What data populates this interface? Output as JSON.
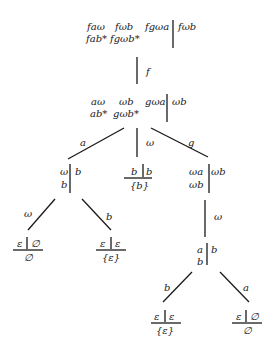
{
  "root": {
    "left_row1": [
      "faω",
      "fωb",
      "fgωa"
    ],
    "left_row2": [
      "fab*",
      "fgωb*"
    ],
    "right": "fωb"
  },
  "edge_f": "f",
  "n1": {
    "left_row1": [
      "aω",
      "ωb",
      "gωa"
    ],
    "left_row2": [
      "ab*",
      "gωb*"
    ],
    "right": "ωb"
  },
  "edges_n1": {
    "a": "a",
    "omega": "ω",
    "g": "g"
  },
  "n_a": {
    "left_row1": "ω",
    "left_row2": "b",
    "right": "b"
  },
  "n_omega": {
    "left": "b",
    "right": "b",
    "result": "{b}"
  },
  "n_g": {
    "left_row1": "ωa",
    "left_row2": "ωb",
    "right": "ωb"
  },
  "edges_na": {
    "omega": "ω",
    "b": "b"
  },
  "leaf_na_omega": {
    "left": "ε",
    "right": "∅",
    "result": "∅"
  },
  "leaf_na_b": {
    "left": "ε",
    "right": "ε",
    "result": "{ε}"
  },
  "edge_ng": "ω",
  "n_gw": {
    "left_row1": "a",
    "left_row2": "b",
    "right": "b"
  },
  "edges_ngw": {
    "b": "b",
    "a": "a"
  },
  "leaf_ngw_b": {
    "left": "ε",
    "right": "ε",
    "result": "{ε}"
  },
  "leaf_ngw_a": {
    "left": "ε",
    "right": "∅",
    "result": "∅"
  }
}
